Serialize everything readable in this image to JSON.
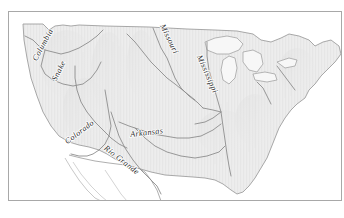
{
  "figure": {
    "kind": "reference-map",
    "frame_border_color": "#a8a8a8",
    "background_color": "#ffffff"
  },
  "map": {
    "land_fill": "#ededed",
    "land_stroke": "#9a9a9a",
    "mexico_fill": "#ffffff",
    "mexico_stroke": "#9a9a9a",
    "lake_fill": "#f7f7f7",
    "lake_stroke": "#9a9a9a",
    "river_stroke": "#8d8d8d",
    "relief_shading": "#d9d9d9",
    "label_color": "#2b2b2b"
  },
  "rivers": [
    {
      "id": "columbia",
      "label": "Columbia",
      "rotation": -62,
      "x": 36,
      "y": 34
    },
    {
      "id": "snake",
      "label": "Snake",
      "rotation": -64,
      "x": 52,
      "y": 60
    },
    {
      "id": "missouri",
      "label": "Missouri",
      "rotation": 64,
      "x": 158,
      "y": 28
    },
    {
      "id": "mississippi",
      "label": "Mississippi",
      "rotation": 66,
      "x": 196,
      "y": 63
    },
    {
      "id": "colorado",
      "label": "Colorado",
      "rotation": -37,
      "x": 72,
      "y": 122
    },
    {
      "id": "arkansas",
      "label": "Arkansas",
      "rotation": -7,
      "x": 138,
      "y": 123
    },
    {
      "id": "rio-grande",
      "label": "Rio Grande",
      "rotation": 38,
      "x": 111,
      "y": 150
    }
  ]
}
